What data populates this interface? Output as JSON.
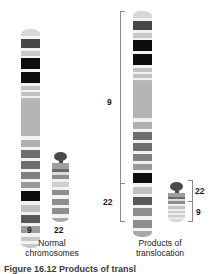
{
  "figure": {
    "caption_partial": "Figure 16.12  Products of transl"
  },
  "panels": [
    {
      "id": "normal",
      "label_line1": "Normal",
      "label_line2": "chromosomes",
      "chromosomes": [
        {
          "id": "normal-9",
          "name": "9",
          "label": "9",
          "type": "submetacentric",
          "bands": [
            {
              "y": 0,
              "h": 7,
              "color": "#d8d8d8"
            },
            {
              "y": 7,
              "h": 3,
              "color": "#f2f2f2"
            },
            {
              "y": 10,
              "h": 9,
              "color": "#484848"
            },
            {
              "y": 19,
              "h": 3,
              "color": "#f2f2f2"
            },
            {
              "y": 22,
              "h": 5,
              "color": "#c8c8c8"
            },
            {
              "y": 27,
              "h": 2,
              "color": "#f2f2f2"
            },
            {
              "y": 29,
              "h": 11,
              "color": "#0d0d0d"
            },
            {
              "y": 40,
              "h": 3,
              "color": "#f2f2f2"
            },
            {
              "y": 43,
              "h": 11,
              "color": "#0d0d0d"
            },
            {
              "y": 54,
              "h": 3,
              "color": "#f2f2f2"
            },
            {
              "y": 57,
              "h": 4,
              "color": "#c2c2c2"
            },
            {
              "y": 61,
              "h": 2,
              "color": "#f2f2f2"
            },
            {
              "y": 63,
              "h": 4,
              "color": "#c2c2c2"
            },
            {
              "y": 67,
              "h": 2,
              "color": "#f2f2f2"
            },
            {
              "y": 69,
              "h": 5,
              "color": "#b8b8b8"
            },
            {
              "y": 74,
              "h": 33,
              "color": "#b4b4b4"
            },
            {
              "y": 107,
              "h": 4,
              "color": "#f2f2f2"
            },
            {
              "y": 111,
              "h": 7,
              "color": "#b0b0b0"
            },
            {
              "y": 118,
              "h": 3,
              "color": "#f2f2f2"
            },
            {
              "y": 121,
              "h": 8,
              "color": "#6e6e6e"
            },
            {
              "y": 129,
              "h": 3,
              "color": "#f2f2f2"
            },
            {
              "y": 132,
              "h": 8,
              "color": "#6e6e6e"
            },
            {
              "y": 140,
              "h": 3,
              "color": "#f2f2f2"
            },
            {
              "y": 143,
              "h": 7,
              "color": "#808080"
            },
            {
              "y": 150,
              "h": 3,
              "color": "#f2f2f2"
            },
            {
              "y": 153,
              "h": 6,
              "color": "#9a9a9a"
            },
            {
              "y": 159,
              "h": 3,
              "color": "#f2f2f2"
            },
            {
              "y": 162,
              "h": 10,
              "color": "#0d0d0d"
            },
            {
              "y": 172,
              "h": 4,
              "color": "#f2f2f2"
            },
            {
              "y": 176,
              "h": 7,
              "color": "#c0c0c0"
            },
            {
              "y": 183,
              "h": 3,
              "color": "#f2f2f2"
            },
            {
              "y": 186,
              "h": 8,
              "color": "#585858"
            },
            {
              "y": 194,
              "h": 3,
              "color": "#f2f2f2"
            },
            {
              "y": 197,
              "h": 7,
              "color": "#9c9c9c"
            },
            {
              "y": 204,
              "h": 4,
              "color": "#f2f2f2"
            },
            {
              "y": 208,
              "h": 4,
              "color": "#c6c6c6"
            },
            {
              "y": 212,
              "h": 3,
              "color": "#f2f2f2"
            },
            {
              "y": 215,
              "h": 4,
              "color": "#c6c6c6"
            }
          ]
        },
        {
          "id": "normal-22",
          "name": "22",
          "label": "22",
          "type": "acrocentric",
          "bands": [
            {
              "y": 0,
              "h": 7,
              "color": "#9e9e9e"
            },
            {
              "y": 7,
              "h": 3,
              "color": "#6a6a6a"
            },
            {
              "y": 10,
              "h": 4,
              "color": "#dcdcdc"
            },
            {
              "y": 14,
              "h": 5,
              "color": "#8c8c8c"
            },
            {
              "y": 19,
              "h": 3,
              "color": "#efefef"
            },
            {
              "y": 22,
              "h": 6,
              "color": "#cfcfcf"
            },
            {
              "y": 28,
              "h": 3,
              "color": "#f2f2f2"
            },
            {
              "y": 31,
              "h": 7,
              "color": "#8e8e8e"
            },
            {
              "y": 38,
              "h": 4,
              "color": "#f2f2f2"
            },
            {
              "y": 42,
              "h": 7,
              "color": "#8e8e8e"
            },
            {
              "y": 49,
              "h": 4,
              "color": "#f2f2f2"
            },
            {
              "y": 53,
              "h": 7,
              "color": "#8e8e8e"
            },
            {
              "y": 60,
              "h": 4,
              "color": "#f2f2f2"
            },
            {
              "y": 64,
              "h": 5,
              "color": "#a8a8a8"
            }
          ]
        }
      ]
    },
    {
      "id": "translocation",
      "label_line1": "Products of",
      "label_line2": "translocation",
      "chromosomes": [
        {
          "id": "der-9",
          "name": "der(9)",
          "bracket_labels": {
            "upper": "9",
            "lower": "22"
          },
          "bands": [
            {
              "y": 0,
              "h": 7,
              "color": "#d8d8d8"
            },
            {
              "y": 7,
              "h": 3,
              "color": "#f2f2f2"
            },
            {
              "y": 10,
              "h": 9,
              "color": "#484848"
            },
            {
              "y": 19,
              "h": 3,
              "color": "#f2f2f2"
            },
            {
              "y": 22,
              "h": 5,
              "color": "#c8c8c8"
            },
            {
              "y": 27,
              "h": 2,
              "color": "#f2f2f2"
            },
            {
              "y": 29,
              "h": 11,
              "color": "#0d0d0d"
            },
            {
              "y": 40,
              "h": 3,
              "color": "#f2f2f2"
            },
            {
              "y": 43,
              "h": 11,
              "color": "#0d0d0d"
            },
            {
              "y": 54,
              "h": 3,
              "color": "#f2f2f2"
            },
            {
              "y": 57,
              "h": 4,
              "color": "#c2c2c2"
            },
            {
              "y": 61,
              "h": 2,
              "color": "#f2f2f2"
            },
            {
              "y": 63,
              "h": 4,
              "color": "#c2c2c2"
            },
            {
              "y": 67,
              "h": 2,
              "color": "#f2f2f2"
            },
            {
              "y": 69,
              "h": 5,
              "color": "#b8b8b8"
            },
            {
              "y": 74,
              "h": 33,
              "color": "#b4b4b4"
            },
            {
              "y": 107,
              "h": 4,
              "color": "#f2f2f2"
            },
            {
              "y": 111,
              "h": 7,
              "color": "#b0b0b0"
            },
            {
              "y": 118,
              "h": 3,
              "color": "#f2f2f2"
            },
            {
              "y": 121,
              "h": 8,
              "color": "#6e6e6e"
            },
            {
              "y": 129,
              "h": 3,
              "color": "#f2f2f2"
            },
            {
              "y": 132,
              "h": 8,
              "color": "#6e6e6e"
            },
            {
              "y": 140,
              "h": 3,
              "color": "#f2f2f2"
            },
            {
              "y": 143,
              "h": 7,
              "color": "#808080"
            },
            {
              "y": 150,
              "h": 3,
              "color": "#f2f2f2"
            },
            {
              "y": 153,
              "h": 6,
              "color": "#9a9a9a"
            },
            {
              "y": 159,
              "h": 3,
              "color": "#f2f2f2"
            },
            {
              "y": 162,
              "h": 10,
              "color": "#0d0d0d"
            },
            {
              "y": 172,
              "h": 4,
              "color": "#f2f2f2"
            },
            {
              "y": 176,
              "h": 7,
              "color": "#c0c0c0"
            },
            {
              "y": 183,
              "h": 3,
              "color": "#f2f2f2"
            },
            {
              "y": 186,
              "h": 8,
              "color": "#585858"
            },
            {
              "y": 194,
              "h": 3,
              "color": "#f2f2f2"
            },
            {
              "y": 197,
              "h": 8,
              "color": "#8e8e8e"
            },
            {
              "y": 205,
              "h": 4,
              "color": "#f2f2f2"
            },
            {
              "y": 209,
              "h": 8,
              "color": "#8e8e8e"
            },
            {
              "y": 217,
              "h": 3,
              "color": "#f2f2f2"
            },
            {
              "y": 220,
              "h": 6,
              "color": "#a8a8a8"
            }
          ]
        },
        {
          "id": "der-22",
          "name": "der(22) Philadelphia",
          "bracket_labels": {
            "upper": "22",
            "lower": "9"
          },
          "bands": [
            {
              "y": 0,
              "h": 7,
              "color": "#9e9e9e"
            },
            {
              "y": 7,
              "h": 3,
              "color": "#6a6a6a"
            },
            {
              "y": 10,
              "h": 4,
              "color": "#dcdcdc"
            },
            {
              "y": 14,
              "h": 5,
              "color": "#8c8c8c"
            },
            {
              "y": 19,
              "h": 3,
              "color": "#efefef"
            },
            {
              "y": 22,
              "h": 5,
              "color": "#c4c4c4"
            },
            {
              "y": 27,
              "h": 3,
              "color": "#efefef"
            },
            {
              "y": 30,
              "h": 4,
              "color": "#cccccc"
            },
            {
              "y": 34,
              "h": 3,
              "color": "#efefef"
            },
            {
              "y": 37,
              "h": 4,
              "color": "#cccccc"
            },
            {
              "y": 41,
              "h": 4,
              "color": "#e6e6e6"
            },
            {
              "y": 45,
              "h": 4,
              "color": "#d2d2d2"
            }
          ]
        }
      ]
    }
  ],
  "colors": {
    "bracket": "#8a8a8a",
    "text": "#1a1a1a",
    "background": "#ffffff"
  }
}
